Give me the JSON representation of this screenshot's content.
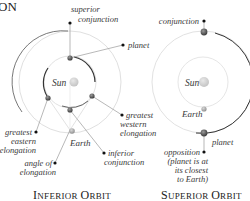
{
  "heading_fragment": "ON",
  "inferior": {
    "title_big1": "I",
    "title_small1": "NFERIOR ",
    "title_big2": "O",
    "title_small2": "RBIT",
    "labels": {
      "superior_conjunction_1": "superior",
      "superior_conjunction_2": "conjunction",
      "planet": "planet",
      "sun": "Sun",
      "greatest_eastern_1": "greatest",
      "greatest_eastern_2": "eastern",
      "greatest_eastern_3": "elongation",
      "greatest_western_1": "greatest",
      "greatest_western_2": "western",
      "greatest_western_3": "elongation",
      "earth": "Earth",
      "inferior_conjunction_1": "inferior",
      "inferior_conjunction_2": "conjunction",
      "angle_1": "angle of",
      "angle_2": "elongation"
    }
  },
  "superior": {
    "title_big1": "S",
    "title_small1": "UPERIOR ",
    "title_big2": "O",
    "title_small2": "RBIT",
    "labels": {
      "conjunction": "conjunction",
      "planet_top": "planet",
      "sun": "Sun",
      "earth": "Earth",
      "planet_bottom": "planet",
      "opposition_1": "opposition",
      "opposition_2": "(planet is at",
      "opposition_3": "its closest",
      "opposition_4": "to Earth)"
    }
  },
  "colors": {
    "orbit": "#d9d9d9",
    "arrow_arc": "#333333",
    "sun": "#cfcfcf",
    "planet": "#555555",
    "earth": "#b5b5b5",
    "text": "#3a3a3a"
  }
}
